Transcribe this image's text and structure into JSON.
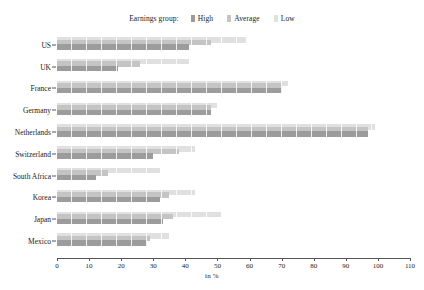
{
  "chart_data": {
    "type": "bar",
    "orientation": "horizontal",
    "title": "",
    "subtitle": "",
    "xlabel": "in %",
    "ylabel": "",
    "xlim": [
      0,
      110
    ],
    "xticks": [
      0,
      10,
      20,
      30,
      40,
      50,
      60,
      70,
      80,
      90,
      100,
      110
    ],
    "grid": false,
    "legend_position": "top-center",
    "legend_title": "Earnings group:",
    "categories": [
      "US",
      "UK",
      "France",
      "Germany",
      "Netherlands",
      "Switzerland",
      "South Africa",
      "Korea",
      "Japan",
      "Mexico"
    ],
    "series": [
      {
        "name": "High",
        "color": "#9c9c9c",
        "values": [
          41,
          19,
          70,
          48,
          97,
          30,
          12,
          32,
          33,
          28
        ]
      },
      {
        "name": "Average",
        "color": "#c4c4c4",
        "values": [
          48,
          26,
          70,
          48,
          97,
          38,
          16,
          35,
          36,
          29
        ]
      },
      {
        "name": "Low",
        "color": "#e0e0e0",
        "values": [
          59,
          41,
          72,
          50,
          99,
          43,
          32,
          43,
          51,
          35
        ]
      }
    ]
  },
  "axis": {
    "x_title": "in %"
  }
}
